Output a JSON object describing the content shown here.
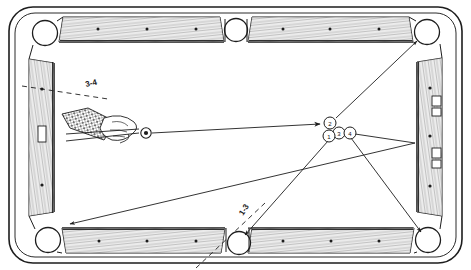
{
  "figure": {
    "kind": "billiards-table-shot-diagram",
    "table": {
      "frame_color": "#1d1d1d",
      "cloth_color": "#ffffff",
      "rail_wood_color": "#9a9a9a",
      "pockets": [
        {
          "name": "top-left-corner-pocket",
          "cx": 45,
          "cy": 33
        },
        {
          "name": "top-center-side-pocket",
          "cx": 236,
          "cy": 30
        },
        {
          "name": "top-right-corner-pocket",
          "cx": 427,
          "cy": 32
        },
        {
          "name": "bottom-left-corner-pocket",
          "cx": 48,
          "cy": 240
        },
        {
          "name": "bottom-center-side-pocket",
          "cx": 239,
          "cy": 243
        },
        {
          "name": "bottom-right-corner-pocket",
          "cx": 428,
          "cy": 240
        }
      ],
      "rail_diamonds_top": [
        98,
        147,
        196,
        283,
        330,
        379
      ],
      "rail_diamonds_bottom": [
        98,
        147,
        196,
        283,
        330,
        379
      ],
      "rail_diamonds_left": [
        88,
        133,
        184
      ],
      "rail_diamonds_right": [
        88,
        133,
        184
      ]
    },
    "cue_ball": {
      "name": "cue-ball",
      "cx": 146,
      "cy": 133,
      "r": 5
    },
    "object_balls": [
      {
        "name": "ball-2",
        "number": "2",
        "cx": 330,
        "cy": 123,
        "r": 6
      },
      {
        "name": "ball-3",
        "number": "3",
        "cx": 339,
        "cy": 132,
        "r": 6
      },
      {
        "name": "ball-4",
        "number": "4",
        "cx": 348,
        "cy": 132,
        "r": 6
      },
      {
        "name": "ball-1",
        "number": "1",
        "cx": 330,
        "cy": 135,
        "r": 6
      }
    ],
    "annotations": [
      {
        "name": "label-3-4",
        "text": "3-4",
        "x": 86,
        "y": 86,
        "rotate": -13
      },
      {
        "name": "label-1-3",
        "text": "1-3",
        "x": 243,
        "y": 214,
        "rotate": -57
      }
    ],
    "shot_lines": [
      {
        "name": "cue-to-cluster-line",
        "desc": "cue ball to ball 2, arrow at cluster"
      },
      {
        "name": "ball2-to-top-right-pocket-line",
        "desc": "cluster up-right to top right corner pocket, arrowed"
      },
      {
        "name": "ball1-to-bottom-center-pocket-line",
        "desc": "cluster down-left to bottom center pocket, arrowed"
      },
      {
        "name": "ball4-to-bottom-right-pocket-line",
        "desc": "cluster down-right to bottom right corner pocket, arrowed"
      },
      {
        "name": "bank-line-to-bottom-left-pocket",
        "desc": "long line from right rail to bottom left corner pocket, arrowed"
      },
      {
        "name": "dashed-aim-line-3-4",
        "desc": "dashed aiming line through 3-4 label"
      },
      {
        "name": "dashed-aim-line-1-3",
        "desc": "dashed aiming line through 1-3 label"
      }
    ],
    "player": {
      "name": "hand-with-cue-stick",
      "desc": "shirt-sleeved hand bridging a cue stick aimed at the cue ball"
    },
    "rail_plates_right": [
      {
        "name": "rail-plate-upper",
        "x": 438,
        "y": 96,
        "w": 9,
        "h": 22
      },
      {
        "name": "rail-plate-lower",
        "x": 438,
        "y": 148,
        "w": 9,
        "h": 22
      }
    ],
    "rail_plate_left": {
      "name": "rail-plate-left",
      "x": 38,
      "y": 126,
      "w": 8,
      "h": 16
    }
  }
}
